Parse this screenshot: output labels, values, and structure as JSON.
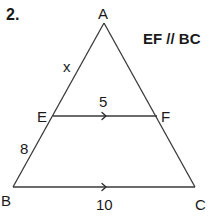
{
  "problem": {
    "number": "2.",
    "condition": "EF // BC"
  },
  "points": {
    "A": {
      "label": "A",
      "x": 104,
      "y": 23
    },
    "B": {
      "label": "B",
      "x": 13,
      "y": 187
    },
    "C": {
      "label": "C",
      "x": 195,
      "y": 187
    },
    "E": {
      "label": "E",
      "x": 53,
      "y": 116
    },
    "F": {
      "label": "F",
      "x": 157,
      "y": 116
    }
  },
  "segments": {
    "AE": {
      "label": "x"
    },
    "EB": {
      "label": "8"
    },
    "EF": {
      "label": "5",
      "parallel_mark": "right-arrow"
    },
    "BC": {
      "label": "10",
      "parallel_mark": "right-arrow"
    }
  },
  "colors": {
    "line": "#3a3a3a",
    "text": "#1a1a1a",
    "background": "#ffffff"
  }
}
